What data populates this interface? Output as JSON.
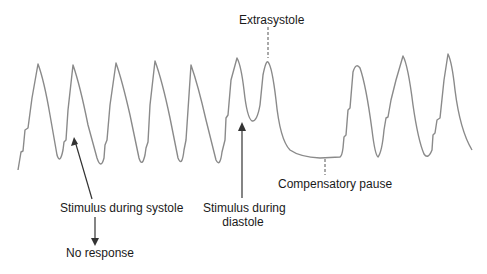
{
  "figure": {
    "labels": {
      "extrasystole": "Extrasystole",
      "stimulus_systole": "Stimulus during systole",
      "no_response": "No response",
      "stimulus_diastole_line1": "Stimulus during",
      "stimulus_diastole_line2": "diastole",
      "compensatory_pause": "Compensatory pause"
    },
    "colors": {
      "trace": "#8a8a8a",
      "arrow": "#333333",
      "text": "#1a1a1a"
    }
  }
}
